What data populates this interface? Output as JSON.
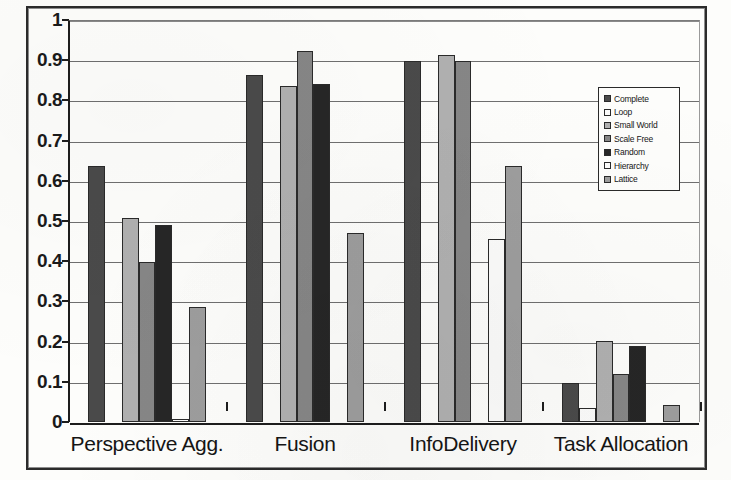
{
  "chart_data": {
    "type": "bar",
    "title": "",
    "subtitle": "",
    "xlabel": "",
    "ylabel": "",
    "ylim": [
      0,
      1
    ],
    "ytick_labels": [
      "1",
      "0.9",
      "0.8",
      "0.7",
      "0.6",
      "0.5",
      "0.4",
      "0.3",
      "0.2",
      "0.1",
      "0"
    ],
    "ytick_values": [
      1,
      0.9,
      0.8,
      0.7,
      0.6,
      0.5,
      0.4,
      0.3,
      0.2,
      0.1,
      0
    ],
    "grid": "horizontal",
    "legend_position": "upper-right-inside",
    "categories": [
      "Perspective Agg.",
      "Fusion",
      "InfoDelivery",
      "Task Allocation"
    ],
    "series": [
      {
        "name": "Complete",
        "color": "#4a4a4a",
        "values": [
          0.637,
          0.863,
          0.897,
          0.096
        ]
      },
      {
        "name": "Loop",
        "color": "#fbfbfa",
        "values": [
          0.0,
          0.0,
          0.0,
          0.036
        ]
      },
      {
        "name": "Small World",
        "color": "#b0b0b0",
        "values": [
          0.508,
          0.835,
          0.913,
          0.202
        ]
      },
      {
        "name": "Scale Free",
        "color": "#868686",
        "values": [
          0.398,
          0.922,
          0.897,
          0.12
        ]
      },
      {
        "name": "Random",
        "color": "#262626",
        "values": [
          0.49,
          0.84,
          0.0,
          0.188
        ]
      },
      {
        "name": "Hierarchy",
        "color": "#fbfbfa",
        "values": [
          0.008,
          0.0,
          0.455,
          0.0
        ]
      },
      {
        "name": "Lattice",
        "color": "#9d9d9d",
        "values": [
          0.287,
          0.47,
          0.637,
          0.042
        ]
      }
    ]
  },
  "legend": {
    "entries": [
      "Complete",
      "Loop",
      "Small World",
      "Scale Free",
      "Random",
      "Hierarchy",
      "Lattice"
    ]
  }
}
